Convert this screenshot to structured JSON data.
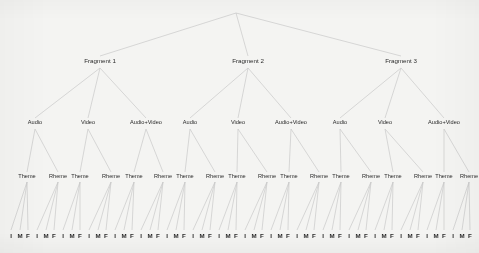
{
  "diagram": {
    "title": "",
    "type": "hierarchical-tree",
    "background_color": "#f4f4f2",
    "edge_color": "#c9c9c9",
    "text_color": "#2b2b2b",
    "levels": [
      "root",
      "fragment",
      "media",
      "theme-rheme",
      "position"
    ],
    "root": {
      "label": "",
      "x": 236,
      "y": 13
    },
    "fragments": [
      {
        "label": "Fragment 1",
        "x": 100,
        "y": 61
      },
      {
        "label": "Fragment 2",
        "x": 248,
        "y": 61
      },
      {
        "label": "Fragment 3",
        "x": 401,
        "y": 61
      }
    ],
    "media": [
      {
        "label": "Audio",
        "x": 35,
        "y": 123
      },
      {
        "label": "Video",
        "x": 88,
        "y": 123
      },
      {
        "label": "Audio+Video",
        "x": 146,
        "y": 123
      },
      {
        "label": "Audio",
        "x": 190,
        "y": 123
      },
      {
        "label": "Video",
        "x": 238,
        "y": 123
      },
      {
        "label": "Audio+Video",
        "x": 291,
        "y": 123
      },
      {
        "label": "Audio",
        "x": 340,
        "y": 123
      },
      {
        "label": "Video",
        "x": 385,
        "y": 123
      },
      {
        "label": "Audio+Video",
        "x": 444,
        "y": 123
      }
    ],
    "theme_rheme": [
      {
        "label": "Theme",
        "x": 27,
        "y": 177
      },
      {
        "label": "Rheme",
        "x": 58,
        "y": 177
      },
      {
        "label": "Theme",
        "x": 80,
        "y": 177
      },
      {
        "label": "Rheme",
        "x": 111,
        "y": 177
      },
      {
        "label": "Theme",
        "x": 134,
        "y": 177
      },
      {
        "label": "Rheme",
        "x": 163,
        "y": 177
      },
      {
        "label": "Theme",
        "x": 185,
        "y": 177
      },
      {
        "label": "Rheme",
        "x": 215,
        "y": 177
      },
      {
        "label": "Theme",
        "x": 237,
        "y": 177
      },
      {
        "label": "Rheme",
        "x": 267,
        "y": 177
      },
      {
        "label": "Theme",
        "x": 289,
        "y": 177
      },
      {
        "label": "Rheme",
        "x": 319,
        "y": 177
      },
      {
        "label": "Theme",
        "x": 341,
        "y": 177
      },
      {
        "label": "Rheme",
        "x": 371,
        "y": 177
      },
      {
        "label": "Theme",
        "x": 393,
        "y": 177
      },
      {
        "label": "Rheme",
        "x": 423,
        "y": 177
      },
      {
        "label": "Theme",
        "x": 444,
        "y": 177
      },
      {
        "label": "Rheme",
        "x": 469,
        "y": 177
      }
    ],
    "leaves": [
      {
        "label": "I",
        "x": 11,
        "y": 236
      },
      {
        "label": "M",
        "x": 20,
        "y": 236
      },
      {
        "label": "F",
        "x": 28,
        "y": 236
      },
      {
        "label": "I",
        "x": 37,
        "y": 236
      },
      {
        "label": "M",
        "x": 46,
        "y": 236
      },
      {
        "label": "F",
        "x": 54,
        "y": 236
      },
      {
        "label": "I",
        "x": 63,
        "y": 236
      },
      {
        "label": "M",
        "x": 72,
        "y": 236
      },
      {
        "label": "F",
        "x": 80,
        "y": 236
      },
      {
        "label": "I",
        "x": 89,
        "y": 236
      },
      {
        "label": "M",
        "x": 98,
        "y": 236
      },
      {
        "label": "F",
        "x": 106,
        "y": 236
      },
      {
        "label": "I",
        "x": 115,
        "y": 236
      },
      {
        "label": "M",
        "x": 124,
        "y": 236
      },
      {
        "label": "F",
        "x": 132,
        "y": 236
      },
      {
        "label": "I",
        "x": 141,
        "y": 236
      },
      {
        "label": "M",
        "x": 150,
        "y": 236
      },
      {
        "label": "F",
        "x": 158,
        "y": 236
      },
      {
        "label": "I",
        "x": 167,
        "y": 236
      },
      {
        "label": "M",
        "x": 176,
        "y": 236
      },
      {
        "label": "F",
        "x": 184,
        "y": 236
      },
      {
        "label": "I",
        "x": 193,
        "y": 236
      },
      {
        "label": "M",
        "x": 202,
        "y": 236
      },
      {
        "label": "F",
        "x": 210,
        "y": 236
      },
      {
        "label": "I",
        "x": 219,
        "y": 236
      },
      {
        "label": "M",
        "x": 228,
        "y": 236
      },
      {
        "label": "F",
        "x": 236,
        "y": 236
      },
      {
        "label": "I",
        "x": 245,
        "y": 236
      },
      {
        "label": "M",
        "x": 254,
        "y": 236
      },
      {
        "label": "F",
        "x": 262,
        "y": 236
      },
      {
        "label": "I",
        "x": 271,
        "y": 236
      },
      {
        "label": "M",
        "x": 280,
        "y": 236
      },
      {
        "label": "F",
        "x": 288,
        "y": 236
      },
      {
        "label": "I",
        "x": 297,
        "y": 236
      },
      {
        "label": "M",
        "x": 306,
        "y": 236
      },
      {
        "label": "F",
        "x": 314,
        "y": 236
      },
      {
        "label": "I",
        "x": 323,
        "y": 236
      },
      {
        "label": "M",
        "x": 332,
        "y": 236
      },
      {
        "label": "F",
        "x": 340,
        "y": 236
      },
      {
        "label": "I",
        "x": 349,
        "y": 236
      },
      {
        "label": "M",
        "x": 358,
        "y": 236
      },
      {
        "label": "F",
        "x": 366,
        "y": 236
      },
      {
        "label": "I",
        "x": 375,
        "y": 236
      },
      {
        "label": "M",
        "x": 384,
        "y": 236
      },
      {
        "label": "F",
        "x": 392,
        "y": 236
      },
      {
        "label": "I",
        "x": 401,
        "y": 236
      },
      {
        "label": "M",
        "x": 410,
        "y": 236
      },
      {
        "label": "F",
        "x": 418,
        "y": 236
      },
      {
        "label": "I",
        "x": 427,
        "y": 236
      },
      {
        "label": "M",
        "x": 436,
        "y": 236
      },
      {
        "label": "F",
        "x": 444,
        "y": 236
      },
      {
        "label": "I",
        "x": 453,
        "y": 236
      },
      {
        "label": "M",
        "x": 462,
        "y": 236
      },
      {
        "label": "F",
        "x": 470,
        "y": 236
      }
    ],
    "edges": [
      {
        "x1": 236,
        "y1": 13,
        "x2": 100,
        "y2": 56
      },
      {
        "x1": 236,
        "y1": 13,
        "x2": 248,
        "y2": 56
      },
      {
        "x1": 236,
        "y1": 13,
        "x2": 401,
        "y2": 56
      },
      {
        "x1": 100,
        "y1": 68,
        "x2": 35,
        "y2": 118
      },
      {
        "x1": 100,
        "y1": 68,
        "x2": 88,
        "y2": 118
      },
      {
        "x1": 100,
        "y1": 68,
        "x2": 146,
        "y2": 118
      },
      {
        "x1": 248,
        "y1": 68,
        "x2": 190,
        "y2": 118
      },
      {
        "x1": 248,
        "y1": 68,
        "x2": 238,
        "y2": 118
      },
      {
        "x1": 248,
        "y1": 68,
        "x2": 291,
        "y2": 118
      },
      {
        "x1": 401,
        "y1": 68,
        "x2": 340,
        "y2": 118
      },
      {
        "x1": 401,
        "y1": 68,
        "x2": 385,
        "y2": 118
      },
      {
        "x1": 401,
        "y1": 68,
        "x2": 444,
        "y2": 118
      },
      {
        "x1": 35,
        "y1": 129,
        "x2": 27,
        "y2": 172
      },
      {
        "x1": 35,
        "y1": 129,
        "x2": 58,
        "y2": 172
      },
      {
        "x1": 88,
        "y1": 129,
        "x2": 80,
        "y2": 172
      },
      {
        "x1": 88,
        "y1": 129,
        "x2": 111,
        "y2": 172
      },
      {
        "x1": 146,
        "y1": 129,
        "x2": 134,
        "y2": 172
      },
      {
        "x1": 146,
        "y1": 129,
        "x2": 163,
        "y2": 172
      },
      {
        "x1": 190,
        "y1": 129,
        "x2": 185,
        "y2": 172
      },
      {
        "x1": 190,
        "y1": 129,
        "x2": 215,
        "y2": 172
      },
      {
        "x1": 238,
        "y1": 129,
        "x2": 237,
        "y2": 172
      },
      {
        "x1": 238,
        "y1": 129,
        "x2": 267,
        "y2": 172
      },
      {
        "x1": 291,
        "y1": 129,
        "x2": 289,
        "y2": 172
      },
      {
        "x1": 291,
        "y1": 129,
        "x2": 319,
        "y2": 172
      },
      {
        "x1": 340,
        "y1": 129,
        "x2": 341,
        "y2": 172
      },
      {
        "x1": 340,
        "y1": 129,
        "x2": 371,
        "y2": 172
      },
      {
        "x1": 385,
        "y1": 129,
        "x2": 393,
        "y2": 172
      },
      {
        "x1": 385,
        "y1": 129,
        "x2": 423,
        "y2": 172
      },
      {
        "x1": 444,
        "y1": 129,
        "x2": 444,
        "y2": 172
      },
      {
        "x1": 444,
        "y1": 129,
        "x2": 469,
        "y2": 172
      }
    ]
  }
}
